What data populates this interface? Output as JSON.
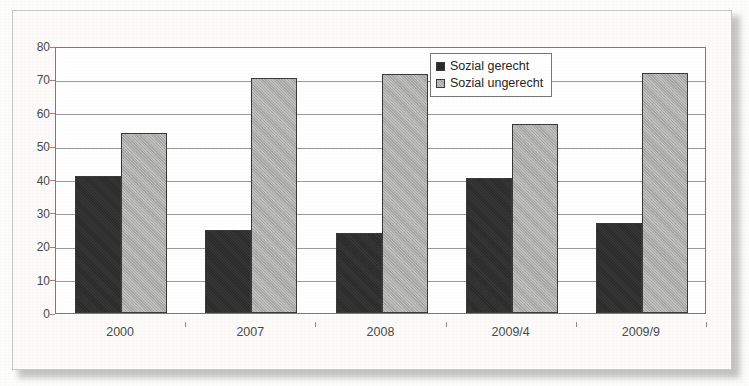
{
  "chart_data": {
    "type": "bar",
    "title": "",
    "xlabel": "",
    "ylabel": "",
    "categories": [
      "2000",
      "2007",
      "2008",
      "2009/4",
      "2009/9"
    ],
    "series": [
      {
        "name": "Sozial gerecht",
        "values": [
          41,
          25,
          24,
          40.5,
          27
        ]
      },
      {
        "name": "Sozial ungerecht",
        "values": [
          54,
          70.5,
          71.5,
          56.5,
          72
        ]
      }
    ],
    "ylim": [
      0,
      80
    ],
    "ytick_step": 10,
    "yticks": [
      "80",
      "70",
      "60",
      "50",
      "40",
      "30",
      "20",
      "10",
      "0"
    ],
    "grid": true,
    "legend_position": "top-right",
    "colors": {
      "series_0": "#2b2b2b",
      "series_1": "#a6a6a4",
      "gridline": "#9b9b99",
      "axis": "#7a7a78",
      "tick_text": "#4a4a48",
      "plot_background": "#ffffff",
      "page_background": "#fcfbfa"
    }
  },
  "legend": {
    "items": [
      {
        "label": "Sozial gerecht"
      },
      {
        "label": "Sozial ungerecht"
      }
    ]
  }
}
